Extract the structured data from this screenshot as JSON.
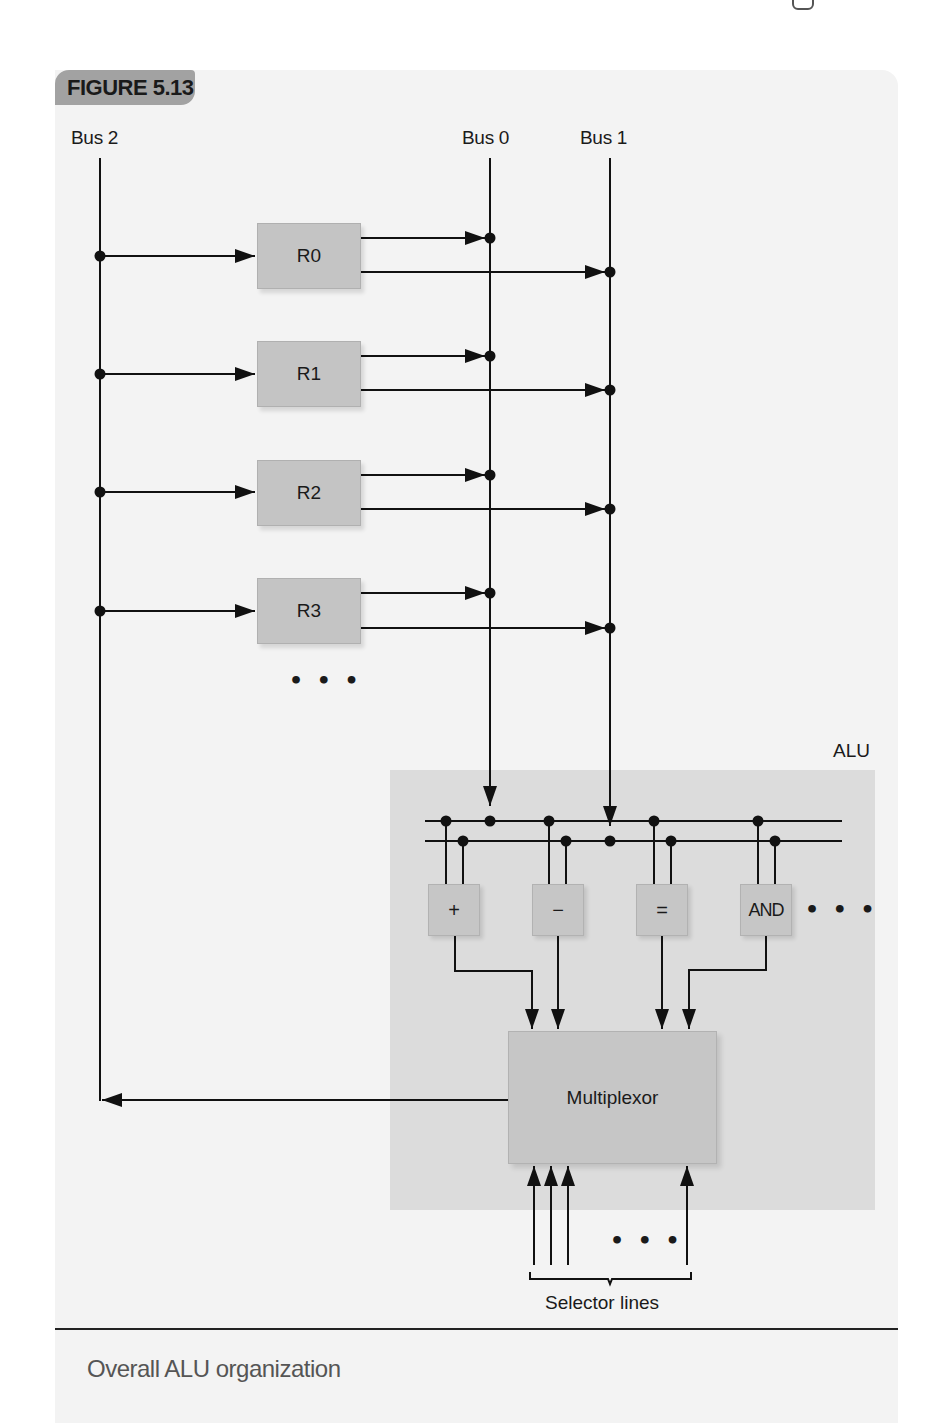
{
  "figure": {
    "tag": "FIGURE 5.13",
    "caption": "Overall ALU organization"
  },
  "buses": {
    "bus2": "Bus 2",
    "bus0": "Bus 0",
    "bus1": "Bus 1"
  },
  "registers": [
    {
      "label": "R0"
    },
    {
      "label": "R1"
    },
    {
      "label": "R2"
    },
    {
      "label": "R3"
    }
  ],
  "register_ellipsis": "• • •",
  "alu": {
    "label": "ALU",
    "operations": [
      {
        "label": "+"
      },
      {
        "label": "−"
      },
      {
        "label": "="
      },
      {
        "label": "AND"
      }
    ],
    "operations_ellipsis": "• • •",
    "multiplexor": "Multiplexor"
  },
  "selector": {
    "label": "Selector lines",
    "ellipsis": "• • •"
  },
  "colors": {
    "panel_bg": "#f3f3f3",
    "alu_bg": "#dcdcdc",
    "box_fill": "#c4c4c4",
    "tag_fill": "#a2a2a2",
    "line": "#111111",
    "caption_text": "#555555"
  }
}
